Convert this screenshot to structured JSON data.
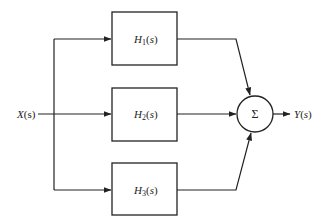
{
  "diagram": {
    "type": "block-diagram",
    "input": {
      "label": "X(s)",
      "main": "X",
      "arg": "(s)"
    },
    "output": {
      "label": "Y(s)",
      "main": "Y",
      "arg": "(s)"
    },
    "blocks": [
      {
        "id": "H1",
        "label": "H1(s)",
        "main": "H",
        "sub": "1",
        "arg": "(s)"
      },
      {
        "id": "H2",
        "label": "H2(s)",
        "main": "H",
        "sub": "2",
        "arg": "(s)"
      },
      {
        "id": "H3",
        "label": "H3(s)",
        "main": "H",
        "sub": "3",
        "arg": "(s)"
      }
    ],
    "summing_junction": {
      "symbol": "Σ"
    },
    "edges": [
      {
        "from": "X(s)",
        "to": "H1"
      },
      {
        "from": "X(s)",
        "to": "H2"
      },
      {
        "from": "X(s)",
        "to": "H3"
      },
      {
        "from": "H1",
        "to": "Σ"
      },
      {
        "from": "H2",
        "to": "Σ"
      },
      {
        "from": "H3",
        "to": "Σ"
      },
      {
        "from": "Σ",
        "to": "Y(s)"
      }
    ],
    "colors": {
      "line": "#222222",
      "background": "#ffffff"
    }
  }
}
